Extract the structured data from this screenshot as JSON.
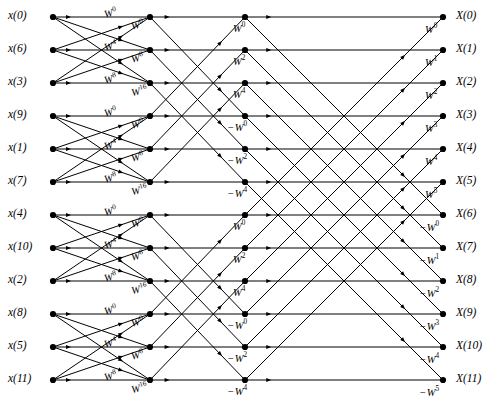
{
  "figure": {
    "type": "fft-flow-graph",
    "n_points": 12,
    "rows": 12,
    "node_columns": 4,
    "stages": 3,
    "ink_color": "#000000",
    "background_color": "#ffffff"
  },
  "inputs": [
    {
      "label": "x(0)",
      "row": 0
    },
    {
      "label": "x(6)",
      "row": 1
    },
    {
      "label": "x(3)",
      "row": 2
    },
    {
      "label": "x(9)",
      "row": 3
    },
    {
      "label": "x(1)",
      "row": 4
    },
    {
      "label": "x(7)",
      "row": 5
    },
    {
      "label": "x(4)",
      "row": 6
    },
    {
      "label": "x(10)",
      "row": 7
    },
    {
      "label": "x(2)",
      "row": 8
    },
    {
      "label": "x(8)",
      "row": 9
    },
    {
      "label": "x(5)",
      "row": 10
    },
    {
      "label": "x(11)",
      "row": 11
    }
  ],
  "outputs": [
    {
      "label": "X(0)",
      "row": 0
    },
    {
      "label": "X(1)",
      "row": 1
    },
    {
      "label": "X(2)",
      "row": 2
    },
    {
      "label": "X(3)",
      "row": 3
    },
    {
      "label": "X(4)",
      "row": 4
    },
    {
      "label": "X(5)",
      "row": 5
    },
    {
      "label": "X(6)",
      "row": 6
    },
    {
      "label": "X(7)",
      "row": 7
    },
    {
      "label": "X(8)",
      "row": 8
    },
    {
      "label": "X(9)",
      "row": 9
    },
    {
      "label": "X(10)",
      "row": 10
    },
    {
      "label": "X(11)",
      "row": 11
    }
  ],
  "stage1_twiddles": [
    {
      "sign": "",
      "exp": "0",
      "row": 0,
      "group": 0
    },
    {
      "sign": "",
      "exp": "0",
      "row": 0,
      "group": 0,
      "second": true
    },
    {
      "sign": "",
      "exp": "4",
      "row": 1,
      "group": 0
    },
    {
      "sign": "",
      "exp": "8",
      "row": 1,
      "group": 0,
      "second": true
    },
    {
      "sign": "",
      "exp": "8",
      "row": 2,
      "group": 0
    },
    {
      "sign": "",
      "exp": "16",
      "row": 2,
      "group": 0,
      "second": true
    },
    {
      "sign": "",
      "exp": "0",
      "row": 3,
      "group": 1
    },
    {
      "sign": "",
      "exp": "0",
      "row": 3,
      "group": 1,
      "second": true
    },
    {
      "sign": "",
      "exp": "4",
      "row": 4,
      "group": 1
    },
    {
      "sign": "",
      "exp": "8",
      "row": 4,
      "group": 1,
      "second": true
    },
    {
      "sign": "",
      "exp": "8",
      "row": 5,
      "group": 1
    },
    {
      "sign": "",
      "exp": "16",
      "row": 5,
      "group": 1,
      "second": true
    },
    {
      "sign": "",
      "exp": "0",
      "row": 6,
      "group": 2
    },
    {
      "sign": "",
      "exp": "0",
      "row": 6,
      "group": 2,
      "second": true
    },
    {
      "sign": "",
      "exp": "4",
      "row": 7,
      "group": 2
    },
    {
      "sign": "",
      "exp": "8",
      "row": 7,
      "group": 2,
      "second": true
    },
    {
      "sign": "",
      "exp": "8",
      "row": 8,
      "group": 2
    },
    {
      "sign": "",
      "exp": "16",
      "row": 8,
      "group": 2,
      "second": true
    },
    {
      "sign": "",
      "exp": "0",
      "row": 9,
      "group": 3
    },
    {
      "sign": "",
      "exp": "0",
      "row": 9,
      "group": 3,
      "second": true
    },
    {
      "sign": "",
      "exp": "4",
      "row": 10,
      "group": 3
    },
    {
      "sign": "",
      "exp": "8",
      "row": 10,
      "group": 3,
      "second": true
    },
    {
      "sign": "",
      "exp": "8",
      "row": 11,
      "group": 3
    },
    {
      "sign": "",
      "exp": "16",
      "row": 11,
      "group": 3,
      "second": true
    }
  ],
  "stage2_twiddles": [
    {
      "sign": "",
      "exp": "0",
      "row": 0
    },
    {
      "sign": "",
      "exp": "2",
      "row": 1
    },
    {
      "sign": "",
      "exp": "4",
      "row": 2
    },
    {
      "sign": "−",
      "exp": "0",
      "row": 3
    },
    {
      "sign": "−",
      "exp": "2",
      "row": 4
    },
    {
      "sign": "−",
      "exp": "4",
      "row": 5
    },
    {
      "sign": "",
      "exp": "0",
      "row": 6
    },
    {
      "sign": "",
      "exp": "2",
      "row": 7
    },
    {
      "sign": "",
      "exp": "4",
      "row": 8
    },
    {
      "sign": "−",
      "exp": "0",
      "row": 9
    },
    {
      "sign": "−",
      "exp": "2",
      "row": 10
    },
    {
      "sign": "−",
      "exp": "4",
      "row": 11
    }
  ],
  "stage3_twiddles": [
    {
      "sign": "",
      "exp": "0",
      "row": 0
    },
    {
      "sign": "",
      "exp": "1",
      "row": 1
    },
    {
      "sign": "",
      "exp": "2",
      "row": 2
    },
    {
      "sign": "",
      "exp": "3",
      "row": 3
    },
    {
      "sign": "",
      "exp": "4",
      "row": 4
    },
    {
      "sign": "",
      "exp": "5",
      "row": 5
    },
    {
      "sign": "−",
      "exp": "0",
      "row": 6
    },
    {
      "sign": "−",
      "exp": "1",
      "row": 7
    },
    {
      "sign": "−",
      "exp": "2",
      "row": 8
    },
    {
      "sign": "−",
      "exp": "3",
      "row": 9
    },
    {
      "sign": "−",
      "exp": "4",
      "row": 10
    },
    {
      "sign": "−",
      "exp": "5",
      "row": 11
    }
  ],
  "geometry": {
    "col_x": [
      53,
      150,
      245,
      443
    ],
    "row_y": [
      17,
      50,
      83,
      116,
      149,
      182,
      215,
      248,
      281,
      314,
      347,
      380
    ],
    "input_label_x": 8,
    "output_label_x": 456,
    "node_radius": 3.1,
    "line_width": 1.0
  }
}
